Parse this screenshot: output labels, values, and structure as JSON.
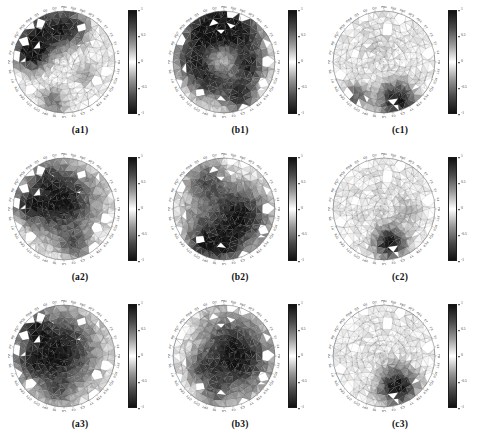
{
  "figure": {
    "background": "#ffffff",
    "rows": 3,
    "cols": 3,
    "colormap": {
      "name": "diverging-gray",
      "stops": [
        "#101010",
        "#4a4a4a",
        "#9a9a9a",
        "#ffffff",
        "#9a9a9a",
        "#4a4a4a",
        "#101010"
      ],
      "description": "dark at both extremes, white at center"
    },
    "head_rim_labels": [
      "Fp1",
      "Fpz",
      "Fp2",
      "AF3",
      "AF4",
      "F7",
      "F3",
      "Fz",
      "F4",
      "F8",
      "FT7",
      "FC3",
      "FCz",
      "FC4",
      "FT8",
      "T7",
      "C3",
      "Cz",
      "C4",
      "T8",
      "TP7",
      "CP3",
      "CPz",
      "CP4",
      "TP8",
      "P7",
      "P3",
      "Pz",
      "P4",
      "P8",
      "PO7",
      "POz",
      "PO8",
      "O1",
      "Oz",
      "O2"
    ]
  },
  "chart_data": [
    {
      "type": "heatmap",
      "id": "a1",
      "label": "(a1)",
      "row": 1,
      "col": 1,
      "colorbar": {
        "ticks": [
          1,
          0.5,
          0,
          -0.5,
          -1
        ],
        "ticklabels": [
          "1",
          "0.5",
          "0",
          "-0.5",
          "-1"
        ],
        "clim": [
          -1,
          1
        ]
      },
      "field_description": "mild activity overall; dark negative patches along upper-left and left rim, faint warm region lower-right",
      "blobs": [
        {
          "cx": 0.3,
          "cy": 0.2,
          "r": 0.17,
          "v": -0.85
        },
        {
          "cx": 0.17,
          "cy": 0.42,
          "r": 0.12,
          "v": -0.95
        },
        {
          "cx": 0.58,
          "cy": 0.16,
          "r": 0.13,
          "v": -0.7
        },
        {
          "cx": 0.72,
          "cy": 0.62,
          "r": 0.11,
          "v": -0.35
        },
        {
          "cx": 0.4,
          "cy": 0.88,
          "r": 0.1,
          "v": -0.55
        },
        {
          "cx": 0.5,
          "cy": 0.55,
          "r": 0.3,
          "v": 0.1
        }
      ]
    },
    {
      "type": "heatmap",
      "id": "b1",
      "label": "(b1)",
      "row": 1,
      "col": 2,
      "colorbar": {
        "ticks": [
          1,
          0.5,
          0,
          -0.5,
          -1
        ],
        "ticklabels": [
          "1",
          "0.5",
          "0",
          "-0.5",
          "-1"
        ],
        "clim": [
          -1,
          1
        ]
      },
      "field_description": "strong patchy structure across whole scalp; large dark focus upper-right of centre",
      "blobs": [
        {
          "cx": 0.62,
          "cy": 0.26,
          "r": 0.19,
          "v": -1.0
        },
        {
          "cx": 0.27,
          "cy": 0.22,
          "r": 0.14,
          "v": -0.8
        },
        {
          "cx": 0.46,
          "cy": 0.13,
          "r": 0.12,
          "v": -0.72
        },
        {
          "cx": 0.19,
          "cy": 0.5,
          "r": 0.13,
          "v": -0.7
        },
        {
          "cx": 0.38,
          "cy": 0.68,
          "r": 0.14,
          "v": -0.85
        },
        {
          "cx": 0.74,
          "cy": 0.56,
          "r": 0.12,
          "v": -0.75
        },
        {
          "cx": 0.66,
          "cy": 0.84,
          "r": 0.11,
          "v": -0.8
        },
        {
          "cx": 0.5,
          "cy": 0.46,
          "r": 0.16,
          "v": 0.55
        }
      ]
    },
    {
      "type": "heatmap",
      "id": "c1",
      "label": "(c1)",
      "row": 1,
      "col": 3,
      "colorbar": {
        "ticks": [
          1,
          0.5,
          0,
          -0.5,
          -1
        ],
        "ticklabels": [
          "1",
          "0.5",
          "0",
          "-0.5",
          "-1"
        ],
        "clim": [
          -1,
          1
        ]
      },
      "field_description": "nearly flat / low amplitude; isolated dark patches at the lower rim",
      "blobs": [
        {
          "cx": 0.62,
          "cy": 0.88,
          "r": 0.13,
          "v": -0.95
        },
        {
          "cx": 0.22,
          "cy": 0.84,
          "r": 0.09,
          "v": -0.55
        },
        {
          "cx": 0.45,
          "cy": 0.3,
          "r": 0.18,
          "v": -0.12
        }
      ]
    },
    {
      "type": "heatmap",
      "id": "a2",
      "label": "(a2)",
      "row": 2,
      "col": 1,
      "colorbar": {
        "ticks": [
          1,
          0.5,
          0,
          -0.5,
          -1
        ],
        "ticklabels": [
          "1",
          "0.5",
          "0",
          "-0.5",
          "-1"
        ],
        "clim": [
          -1,
          1
        ]
      },
      "field_description": "single strong dark focus slightly above centre with graded halo",
      "blobs": [
        {
          "cx": 0.47,
          "cy": 0.42,
          "r": 0.24,
          "v": -1.0
        },
        {
          "cx": 0.14,
          "cy": 0.46,
          "r": 0.11,
          "v": -0.55
        },
        {
          "cx": 0.6,
          "cy": 0.86,
          "r": 0.1,
          "v": -0.5
        },
        {
          "cx": 0.3,
          "cy": 0.14,
          "r": 0.1,
          "v": -0.35
        }
      ]
    },
    {
      "type": "heatmap",
      "id": "b2",
      "label": "(b2)",
      "row": 2,
      "col": 2,
      "colorbar": {
        "ticks": [
          1,
          0.5,
          0,
          -0.5,
          -1
        ],
        "ticklabels": [
          "1",
          "0.5",
          "0",
          "-0.5",
          "-1"
        ],
        "clim": [
          -1,
          1
        ]
      },
      "field_description": "dark focus right of centre below midline; secondary patches upper-left and lower-left",
      "blobs": [
        {
          "cx": 0.64,
          "cy": 0.58,
          "r": 0.21,
          "v": -1.0
        },
        {
          "cx": 0.32,
          "cy": 0.22,
          "r": 0.14,
          "v": -0.6
        },
        {
          "cx": 0.3,
          "cy": 0.84,
          "r": 0.12,
          "v": -0.8
        },
        {
          "cx": 0.52,
          "cy": 0.88,
          "r": 0.1,
          "v": -0.65
        },
        {
          "cx": 0.2,
          "cy": 0.58,
          "r": 0.12,
          "v": -0.25
        }
      ]
    },
    {
      "type": "heatmap",
      "id": "c2",
      "label": "(c2)",
      "row": 2,
      "col": 3,
      "colorbar": {
        "ticks": [
          1,
          0.5,
          0,
          -0.5,
          -1
        ],
        "ticklabels": [
          "1",
          "0.5",
          "0",
          "-0.5",
          "-1"
        ],
        "clim": [
          -1,
          1
        ]
      },
      "field_description": "almost uniform background; one compact dark patch lower-centre-right",
      "blobs": [
        {
          "cx": 0.56,
          "cy": 0.84,
          "r": 0.11,
          "v": -0.95
        },
        {
          "cx": 0.74,
          "cy": 0.52,
          "r": 0.09,
          "v": -0.22
        },
        {
          "cx": 0.45,
          "cy": 0.45,
          "r": 0.22,
          "v": -0.08
        }
      ]
    },
    {
      "type": "heatmap",
      "id": "a3",
      "label": "(a3)",
      "row": 3,
      "col": 1,
      "colorbar": {
        "ticks": [
          1,
          0.5,
          0,
          -0.5,
          -1
        ],
        "ticklabels": [
          "1",
          "0.5",
          "0",
          "-0.5",
          "-1"
        ],
        "clim": [
          -1,
          1
        ]
      },
      "field_description": "large saturated dark blob centred slightly left and above midline",
      "blobs": [
        {
          "cx": 0.43,
          "cy": 0.45,
          "r": 0.27,
          "v": -1.0
        },
        {
          "cx": 0.2,
          "cy": 0.2,
          "r": 0.1,
          "v": -0.45
        },
        {
          "cx": 0.16,
          "cy": 0.56,
          "r": 0.1,
          "v": -0.35
        },
        {
          "cx": 0.44,
          "cy": 0.86,
          "r": 0.1,
          "v": -0.3
        }
      ]
    },
    {
      "type": "heatmap",
      "id": "b3",
      "label": "(b3)",
      "row": 3,
      "col": 2,
      "colorbar": {
        "ticks": [
          1,
          0.5,
          0,
          -0.5,
          -1
        ],
        "ticklabels": [
          "1",
          "0.5",
          "0",
          "-0.5",
          "-1"
        ],
        "clim": [
          -1,
          1
        ]
      },
      "field_description": "saturated dark blob right of centre, elongated horizontally; faint band across upper scalp",
      "blobs": [
        {
          "cx": 0.62,
          "cy": 0.52,
          "r": 0.24,
          "v": -1.0
        },
        {
          "cx": 0.26,
          "cy": 0.62,
          "r": 0.1,
          "v": -0.4
        },
        {
          "cx": 0.4,
          "cy": 0.86,
          "r": 0.1,
          "v": -0.35
        },
        {
          "cx": 0.5,
          "cy": 0.16,
          "r": 0.2,
          "v": -0.18
        }
      ]
    },
    {
      "type": "heatmap",
      "id": "c3",
      "label": "(c3)",
      "row": 3,
      "col": 3,
      "colorbar": {
        "ticks": [
          1,
          0.5,
          0,
          -0.5,
          -1
        ],
        "ticklabels": [
          "1",
          "0.5",
          "0",
          "-0.5",
          "-1"
        ],
        "clim": [
          -1,
          1
        ]
      },
      "field_description": "flat background with a single compact saturated dark blob at lower right",
      "blobs": [
        {
          "cx": 0.63,
          "cy": 0.8,
          "r": 0.13,
          "v": -1.0
        },
        {
          "cx": 0.45,
          "cy": 0.4,
          "r": 0.22,
          "v": -0.06
        }
      ]
    }
  ]
}
